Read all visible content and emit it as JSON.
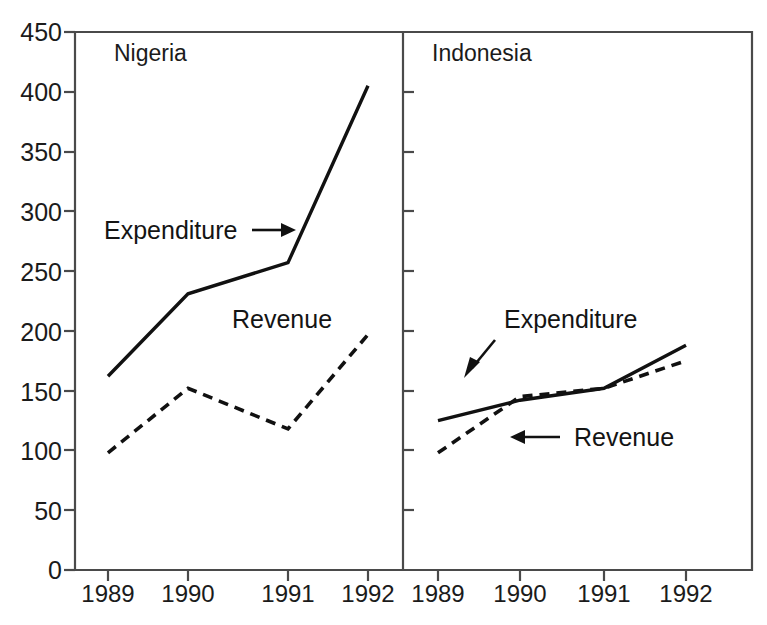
{
  "chart_data": {
    "type": "line",
    "title": "",
    "xlabel": "",
    "ylabel": "",
    "ylim": [
      0,
      450
    ],
    "grid": false,
    "legend_position": "inline-annotations",
    "categories": [
      "1989",
      "1990",
      "1991",
      "1992"
    ],
    "x": [
      1989,
      1990,
      1991,
      1992
    ],
    "yticks": [
      0,
      50,
      100,
      150,
      200,
      250,
      300,
      350,
      400,
      450
    ],
    "panels": [
      {
        "name": "Nigeria",
        "series": [
          {
            "name": "Expenditure",
            "style": "solid",
            "values": [
              162,
              231,
              257,
              405
            ],
            "annotation": "Expenditure",
            "annotation_arrow": "right"
          },
          {
            "name": "Revenue",
            "style": "dashed",
            "values": [
              98,
              152,
              118,
              197
            ],
            "annotation": "Revenue",
            "annotation_arrow": "none"
          }
        ]
      },
      {
        "name": "Indonesia",
        "series": [
          {
            "name": "Expenditure",
            "style": "solid",
            "values": [
              125,
              142,
              152,
              188
            ],
            "annotation": "Expenditure",
            "annotation_arrow": "down-left"
          },
          {
            "name": "Revenue",
            "style": "dashed",
            "values": [
              98,
              145,
              152,
              175
            ],
            "annotation": "Revenue",
            "annotation_arrow": "left"
          }
        ]
      }
    ]
  },
  "axis": {
    "y_labels": [
      "450",
      "400",
      "350",
      "300",
      "250",
      "200",
      "150",
      "100",
      "50",
      "0"
    ],
    "x_labels_left": [
      "1989",
      "1990",
      "1991",
      "1992"
    ],
    "x_labels_right": [
      "1989",
      "1990",
      "1991",
      "1992"
    ]
  },
  "panel_left": {
    "title": "Nigeria",
    "expenditure_label": "Expenditure",
    "revenue_label": "Revenue"
  },
  "panel_right": {
    "title": "Indonesia",
    "expenditure_label": "Expenditure",
    "revenue_label": "Revenue"
  }
}
